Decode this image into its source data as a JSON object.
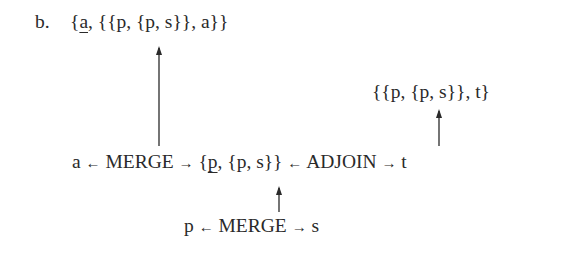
{
  "example_label": "b.",
  "top_structure": {
    "open": "{",
    "underlined": "a",
    "rest": ", {{p, {p, s}}, a}}"
  },
  "adjoin_result": "{{p, {p, s}}, t}",
  "middle_row": {
    "left_input": "a",
    "left_arrow": "←",
    "merge_label": "MERGE",
    "right_arrow": "→",
    "set_open": "{",
    "set_underlined": "p",
    "set_rest": ", {p, s}}",
    "adjoin_left_arrow": "←",
    "adjoin_label": "ADJOIN",
    "adjoin_right_arrow": "→",
    "adjoin_input": "t"
  },
  "bottom_row": {
    "left_input": "p",
    "left_arrow": "←",
    "merge_label": "MERGE",
    "right_arrow": "→",
    "right_input": "s"
  }
}
